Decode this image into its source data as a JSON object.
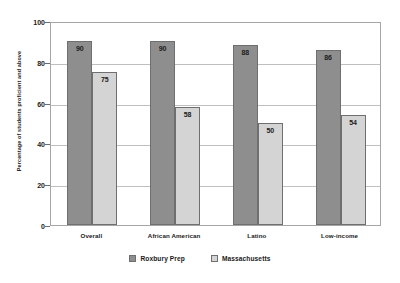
{
  "chart_data": {
    "type": "bar",
    "title": "",
    "xlabel": "",
    "ylabel": "Percentage of students proficient and above",
    "ylim": [
      0,
      100
    ],
    "yticks": [
      0,
      20,
      40,
      60,
      80,
      100
    ],
    "grid": true,
    "legend_position": "bottom",
    "categories": [
      "Overall",
      "African American",
      "Latino",
      "Low-income"
    ],
    "series": [
      {
        "name": "Roxbury Prep",
        "color": "#8e8e8e",
        "values": [
          90,
          90,
          88,
          86
        ]
      },
      {
        "name": "Massachusetts",
        "color": "#d4d4d4",
        "values": [
          75,
          58,
          50,
          54
        ]
      }
    ]
  },
  "axis": {
    "y_title": "Percentage of students proficient and above",
    "tick_labels": [
      "0",
      "20",
      "40",
      "60",
      "80",
      "100"
    ]
  },
  "legend": {
    "entries": [
      {
        "label": "Roxbury Prep",
        "swatch": "dark-gray"
      },
      {
        "label": "Massachusetts",
        "swatch": "light-gray"
      }
    ]
  },
  "colors": {
    "series_roxbury": "#8e8e8e",
    "series_massachusetts": "#d4d4d4",
    "frame": "#a6a6a6",
    "gridline": "#bfbfbf"
  }
}
